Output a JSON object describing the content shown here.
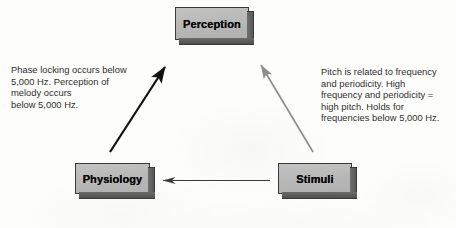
{
  "figure": {
    "background_color": "#fdfdfc"
  },
  "nodes": [
    {
      "id": "perception",
      "label": "Perception",
      "fill_color": "#b9b9b9",
      "border_color": "#3a3a3a",
      "text_color": "#0b0b0b"
    },
    {
      "id": "physiology",
      "label": "Physiology",
      "fill_color": "#b9b9b9",
      "border_color": "#3a3a3a",
      "text_color": "#0b0b0b"
    },
    {
      "id": "stimuli",
      "label": "Stimuli",
      "fill_color": "#b9b9b9",
      "border_color": "#3a3a3a",
      "text_color": "#0b0b0b"
    }
  ],
  "annotations": {
    "left": {
      "text": "Phase locking occurs below\n5,000 Hz. Perception of\nmelody occurs\nbelow 5,000 Hz.",
      "color": "#2f2f2f",
      "relates_to": "physiology-to-perception"
    },
    "right": {
      "text": "Pitch is related to frequency\nand periodicity. High\nfrequency and periodicity =\nhigh pitch. Holds for\nfrequencies below 5,000 Hz.",
      "color": "#2f2f2f",
      "relates_to": "stimuli-to-perception"
    }
  },
  "arrows": [
    {
      "id": "physiology-to-perception",
      "from": "physiology",
      "to": "perception",
      "color": "#111111",
      "width": 2.2,
      "direction": "up-right"
    },
    {
      "id": "stimuli-to-perception",
      "from": "stimuli",
      "to": "perception",
      "color": "#8e8e8e",
      "width": 1.7,
      "direction": "up-left"
    },
    {
      "id": "stimuli-to-physiology",
      "from": "stimuli",
      "to": "physiology",
      "color": "#3b3b3b",
      "width": 1.2,
      "direction": "left"
    }
  ]
}
